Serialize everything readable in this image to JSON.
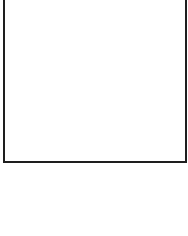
{
  "panel": {
    "content": "",
    "border_color": "#1e1e1e",
    "background_color": "#ffffff"
  },
  "below_area": {
    "content": ""
  }
}
